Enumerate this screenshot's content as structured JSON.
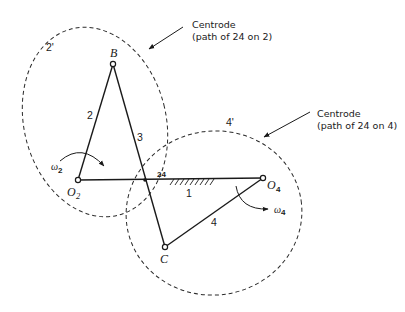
{
  "diagram": {
    "centrode_2": {
      "label": "2'",
      "callout_line1": "Centrode",
      "callout_line2": "(path of 24 on 2)"
    },
    "centrode_4": {
      "label": "4'",
      "callout_line1": "Centrode",
      "callout_line2": "(path of 24 on 4)"
    },
    "points": {
      "B": "B",
      "C": "C",
      "O2": "O",
      "O2_sub": "2",
      "O4": "O",
      "O4_sub": "4",
      "instant_center": "24"
    },
    "links": {
      "link_1": "1",
      "link_2": "2",
      "link_3": "3",
      "link_4": "4"
    },
    "angular_velocity": {
      "omega_2": "ω",
      "omega_2_sub": "2",
      "omega_4": "ω",
      "omega_4_sub": "4"
    },
    "colors": {
      "ink": "#1a1a1a",
      "background": "#ffffff"
    }
  }
}
